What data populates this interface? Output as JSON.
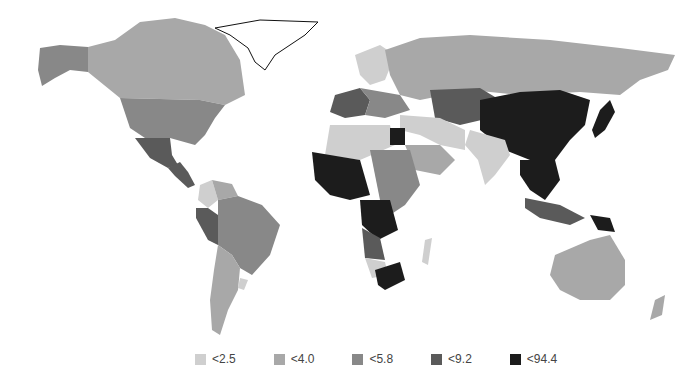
{
  "map": {
    "type": "world choropleth",
    "colorscale": "grayscale",
    "classes": [
      {
        "id": "c1",
        "label": "<2.5",
        "color": "#cfcfcf"
      },
      {
        "id": "c2",
        "label": "<4.0",
        "color": "#a8a8a8"
      },
      {
        "id": "c3",
        "label": "<5.8",
        "color": "#888888"
      },
      {
        "id": "c4",
        "label": "<9.2",
        "color": "#5a5a5a"
      },
      {
        "id": "c5",
        "label": "<94.4",
        "color": "#1c1c1c"
      }
    ],
    "regions": [
      {
        "name": "Canada",
        "class": "c2"
      },
      {
        "name": "Alaska (USA)",
        "class": "c3"
      },
      {
        "name": "United States",
        "class": "c3"
      },
      {
        "name": "Mexico",
        "class": "c4"
      },
      {
        "name": "Central America",
        "class": "c4"
      },
      {
        "name": "Greenland",
        "class": "none"
      },
      {
        "name": "Colombia",
        "class": "c1"
      },
      {
        "name": "Venezuela",
        "class": "c2"
      },
      {
        "name": "Peru/Ecuador",
        "class": "c4"
      },
      {
        "name": "Brazil",
        "class": "c3"
      },
      {
        "name": "Argentina/Chile",
        "class": "c2"
      },
      {
        "name": "Uruguay",
        "class": "c1"
      },
      {
        "name": "Russia",
        "class": "c2"
      },
      {
        "name": "Scandinavia",
        "class": "c1"
      },
      {
        "name": "Western Europe",
        "class": "c4"
      },
      {
        "name": "Eastern Europe",
        "class": "c3"
      },
      {
        "name": "Kazakhstan / Central Asia",
        "class": "c4"
      },
      {
        "name": "China",
        "class": "c5"
      },
      {
        "name": "Japan",
        "class": "c5"
      },
      {
        "name": "Southeast Asia",
        "class": "c5"
      },
      {
        "name": "India",
        "class": "c1"
      },
      {
        "name": "Middle East",
        "class": "c1"
      },
      {
        "name": "Saudi Arabia",
        "class": "c2"
      },
      {
        "name": "Egypt",
        "class": "c5"
      },
      {
        "name": "North Africa",
        "class": "c1"
      },
      {
        "name": "West Africa",
        "class": "c5"
      },
      {
        "name": "Central Africa (DRC)",
        "class": "c5"
      },
      {
        "name": "East Africa",
        "class": "c3"
      },
      {
        "name": "Angola",
        "class": "c4"
      },
      {
        "name": "Southern Africa (Namibia)",
        "class": "c1"
      },
      {
        "name": "South Africa",
        "class": "c5"
      },
      {
        "name": "Madagascar",
        "class": "c1"
      },
      {
        "name": "Indonesia",
        "class": "c4"
      },
      {
        "name": "Papua New Guinea",
        "class": "c5"
      },
      {
        "name": "Australia",
        "class": "c2"
      },
      {
        "name": "New Zealand",
        "class": "c2"
      }
    ]
  },
  "legend": {
    "items": [
      {
        "label": "<2.5",
        "color": "#cfcfcf"
      },
      {
        "label": "<4.0",
        "color": "#a8a8a8"
      },
      {
        "label": "<5.8",
        "color": "#888888"
      },
      {
        "label": "<9.2",
        "color": "#5a5a5a"
      },
      {
        "label": "<94.4",
        "color": "#1c1c1c"
      }
    ]
  }
}
